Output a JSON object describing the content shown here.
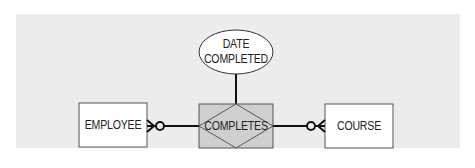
{
  "diagram": {
    "type": "entity-relationship",
    "background_color": "#ececec",
    "relationship_fill": "#cfcfcf",
    "entities": [
      {
        "id": "employee",
        "label": "EMPLOYEE"
      },
      {
        "id": "course",
        "label": "COURSE"
      }
    ],
    "relationship": {
      "id": "completes",
      "label": "COMPLETES",
      "style": "associative-entity"
    },
    "attribute": {
      "id": "date_completed",
      "label_line1": "DATE",
      "label_line2": "COMPLETED"
    },
    "connections": [
      {
        "from": "employee",
        "to": "completes",
        "cardinality_at_employee": "zero-or-many"
      },
      {
        "from": "completes",
        "to": "course",
        "cardinality_at_course": "zero-or-many"
      },
      {
        "from": "completes",
        "to": "date_completed",
        "type": "attribute-link"
      }
    ]
  }
}
